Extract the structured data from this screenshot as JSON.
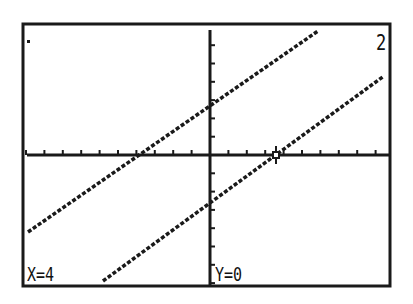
{
  "calculator_screen": {
    "type": "graph",
    "graph_number": "2",
    "cursor": {
      "x_label": "X=4",
      "y_label": "Y=0",
      "style": "crosshair"
    },
    "colors": {
      "background": "#ffffff",
      "foreground": "#1a1a1a"
    }
  },
  "chart_data": {
    "type": "line",
    "title": "",
    "xlabel": "",
    "ylabel": "",
    "grid": false,
    "axes": {
      "x_ticks": true,
      "y_ticks": true
    },
    "cursor_point": {
      "x": 4,
      "y": 0
    },
    "series": [
      {
        "name": "upper line",
        "description": "parallel line crossing y-axis above origin",
        "x": [
          -10,
          6
        ],
        "y": [
          -4.2,
          6.6
        ]
      },
      {
        "name": "lower line",
        "description": "parallel line with x-intercept at x=4",
        "x": [
          -6,
          9.4
        ],
        "y": [
          -6.9,
          4.4
        ]
      }
    ]
  }
}
